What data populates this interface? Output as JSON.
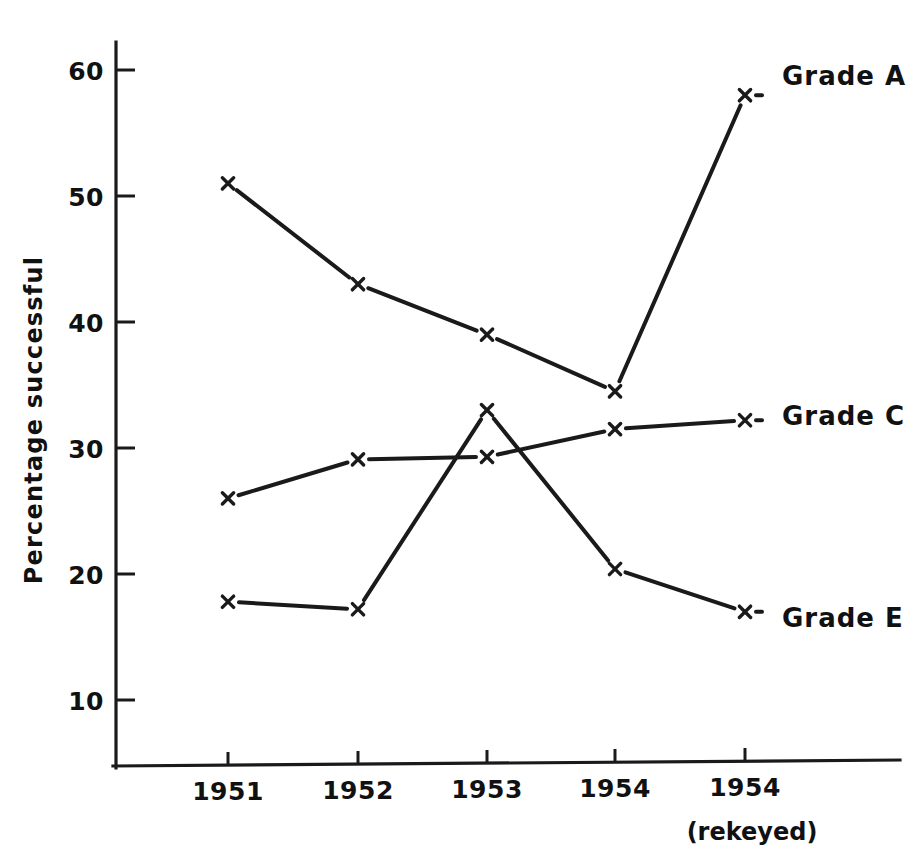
{
  "chart_data": {
    "type": "line",
    "title": "",
    "xlabel": "",
    "ylabel": "Percentage successful",
    "categories": [
      "1951",
      "1952",
      "1953",
      "1954",
      "1954"
    ],
    "category_sublabels": [
      "",
      "",
      "",
      "",
      "(rekeyed)"
    ],
    "yticks": [
      10,
      20,
      30,
      40,
      50,
      60
    ],
    "ytick_labels": [
      "10",
      "20",
      "30",
      "40",
      "50",
      "60"
    ],
    "ylim": [
      4,
      64
    ],
    "grid": false,
    "legend_position": "right-inline",
    "marker": "x",
    "series": [
      {
        "name": "Grade A",
        "label": "Grade A",
        "values": [
          51.0,
          43.0,
          39.0,
          34.5,
          58.0
        ]
      },
      {
        "name": "Grade C",
        "label": "Grade C",
        "values": [
          26.0,
          29.1,
          29.3,
          31.5,
          32.2
        ]
      },
      {
        "name": "Grade E",
        "label": "Grade E",
        "values": [
          17.8,
          17.2,
          33.0,
          20.4,
          17.0
        ]
      }
    ]
  },
  "axes": {
    "y_axis_title": "Percentage successful",
    "x_rekeyed_note": "(rekeyed)"
  },
  "legend": {
    "items": [
      {
        "label": "Grade A",
        "marker": "x"
      },
      {
        "label": "Grade C",
        "marker": "x"
      },
      {
        "label": "Grade E",
        "marker": "x"
      }
    ]
  },
  "ytick_text": {
    "t10": "10",
    "t20": "20",
    "t30": "30",
    "t40": "40",
    "t50": "50",
    "t60": "60"
  },
  "xtick_text": {
    "t1": "1951",
    "t2": "1952",
    "t3": "1953",
    "t4": "1954",
    "t5": "1954",
    "t5sub": "(rekeyed)"
  },
  "colors": {
    "ink": "#1a1a1a",
    "background": "#ffffff"
  }
}
